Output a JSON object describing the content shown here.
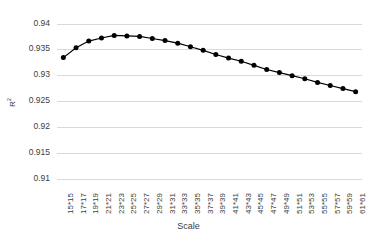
{
  "chart_data": {
    "type": "line",
    "title": "",
    "xlabel": "Scale",
    "ylabel": "R²",
    "ylim": [
      0.91,
      0.94
    ],
    "ytick_labels": [
      "0.94",
      "0.935",
      "0.93",
      "0.925",
      "0.92",
      "0.915",
      "0.91"
    ],
    "ytick_values": [
      0.94,
      0.935,
      0.93,
      0.925,
      0.92,
      0.915,
      0.91
    ],
    "grid": true,
    "legend": "none",
    "marker": "filled-circle",
    "line_color": "#000000",
    "marker_color": "#000000",
    "grid_color": "#d9d9d9",
    "background_color": "#ffffff",
    "categories": [
      "15*15",
      "17*17",
      "19*19",
      "21*21",
      "23*23",
      "25*25",
      "27*27",
      "29*29",
      "31*31",
      "33*33",
      "35*35",
      "37*37",
      "39*39",
      "41*41",
      "43*43",
      "45*45",
      "47*47",
      "49*49",
      "51*51",
      "53*53",
      "55*55",
      "57*57",
      "59*59",
      "61*61"
    ],
    "values": [
      0.9334,
      0.9353,
      0.9366,
      0.9372,
      0.9377,
      0.9376,
      0.9375,
      0.9371,
      0.9367,
      0.9362,
      0.9355,
      0.9348,
      0.934,
      0.9333,
      0.9327,
      0.9319,
      0.9311,
      0.9305,
      0.9299,
      0.9293,
      0.9286,
      0.928,
      0.9274,
      0.9268
    ]
  }
}
